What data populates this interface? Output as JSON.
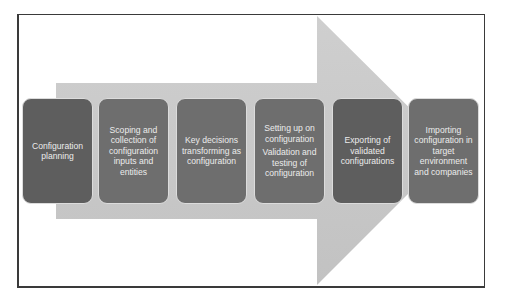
{
  "diagram": {
    "type": "process-flow",
    "arrow_color": "#c6c6c6",
    "box_color": "#6e6e6e",
    "text_color": "#ececec",
    "steps": [
      {
        "paragraphs": [
          "Configuration planning"
        ]
      },
      {
        "paragraphs": [
          "Scoping and collection of configuration inputs and entities"
        ]
      },
      {
        "paragraphs": [
          "Key decisions transforming as configuration"
        ]
      },
      {
        "paragraphs": [
          "Setting up on configuration",
          "Validation and testing of configuration"
        ]
      },
      {
        "paragraphs": [
          "Exporting of validated configurations"
        ]
      },
      {
        "paragraphs": [
          "Importing configuration in target environment and companies"
        ]
      }
    ]
  }
}
